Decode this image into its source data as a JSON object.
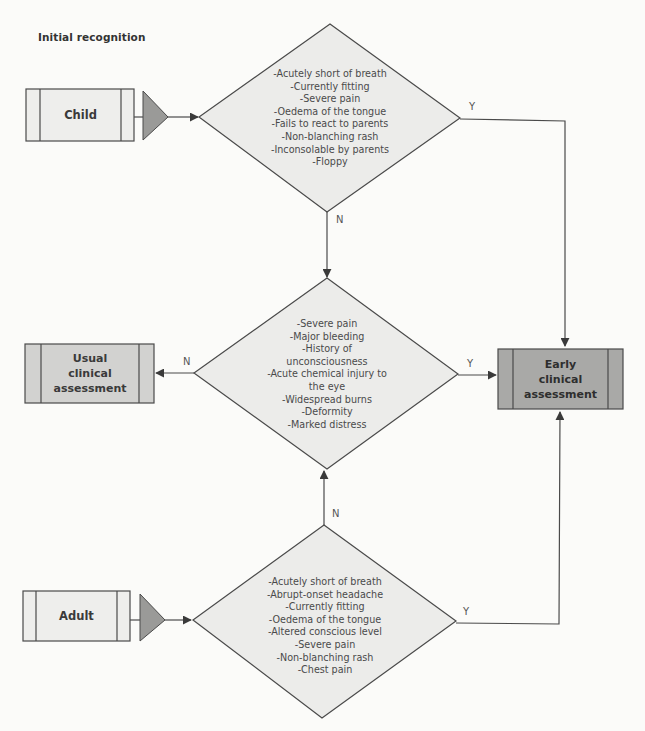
{
  "title": "Initial recognition",
  "colors": {
    "background": "#fbfbf9",
    "diamond_fill": "#ececea",
    "entry_box_fill": "#eeeeec",
    "usual_box_fill": "#d2d2d0",
    "early_box_fill": "#a9a9a7",
    "triangle_fill": "#9a9a98",
    "stroke": "#4a4a4a"
  },
  "nodes": {
    "child": {
      "label": "Child"
    },
    "adult": {
      "label": "Adult"
    },
    "usual": {
      "line1": "Usual",
      "line2": "clinical",
      "line3": "assessment"
    },
    "early": {
      "line1": "Early",
      "line2": "clinical",
      "line3": "assessment"
    }
  },
  "decisions": {
    "child_criteria": {
      "items": [
        "-Acutely short of breath",
        "-Currently fitting",
        "-Severe pain",
        "-Oedema of the tongue",
        "-Fails to react to parents",
        "-Non-blanching rash",
        "-Inconsolable by parents",
        "-Floppy"
      ]
    },
    "general_criteria": {
      "items": [
        "-Severe pain",
        "-Major bleeding",
        "-History of",
        "unconsciousness",
        "-Acute chemical injury to",
        "the eye",
        "-Widespread burns",
        "-Deformity",
        "-Marked distress"
      ]
    },
    "adult_criteria": {
      "items": [
        "-Acutely short of breath",
        "-Abrupt-onset headache",
        "-Currently fitting",
        "-Oedema of the tongue",
        "-Altered conscious level",
        "-Severe pain",
        "-Non-blanching rash",
        "-Chest pain"
      ]
    }
  },
  "edges": {
    "child_yes": "Y",
    "child_no": "N",
    "general_no": "N",
    "general_yes": "Y",
    "adult_no": "N",
    "adult_yes": "Y"
  }
}
